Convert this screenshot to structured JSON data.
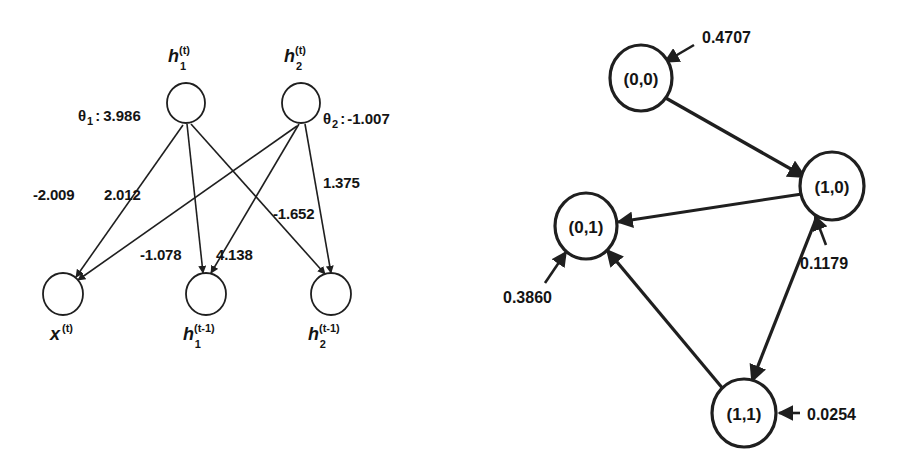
{
  "figure": {
    "background_color": "#ffffff",
    "ink_color": "#1f1f1f",
    "panels": [
      "rnn-weight-diagram",
      "state-transition-diagram"
    ]
  },
  "rnn_diagram": {
    "title": "",
    "nodes": {
      "h1_t": {
        "name": "h",
        "sub": "1",
        "sup": "(t)",
        "cx": 186,
        "cy": 103,
        "r": 19
      },
      "h2_t": {
        "name": "h",
        "sub": "2",
        "sup": "(t)",
        "cx": 301,
        "cy": 103,
        "r": 19
      },
      "x_t": {
        "name": "x",
        "sub": "",
        "sup": "(t)",
        "cx": 63,
        "cy": 294,
        "r": 20
      },
      "h1_tm1": {
        "name": "h",
        "sub": "1",
        "sup": "(t-1)",
        "cx": 206,
        "cy": 294,
        "r": 20
      },
      "h2_tm1": {
        "name": "h",
        "sub": "2",
        "sup": "(t-1)",
        "cx": 331,
        "cy": 294,
        "r": 20
      }
    },
    "biases": [
      {
        "symbol": "θ",
        "sub": "1",
        "separator": ":",
        "value": "3.986",
        "full": "θ 1 : 3.986"
      },
      {
        "symbol": "θ",
        "sub": "2",
        "separator": ":",
        "value": "-1.007",
        "full": "θ 2 : -1.007"
      }
    ],
    "edges": [
      {
        "id": "x-to-h1",
        "from": "x_t",
        "to": "h1_t",
        "weight": "-2.009"
      },
      {
        "id": "x-to-h2",
        "from": "x_t",
        "to": "h2_t",
        "weight": "2.012"
      },
      {
        "id": "h1prev-to-h1",
        "from": "h1_tm1",
        "to": "h1_t",
        "weight": "-1.078"
      },
      {
        "id": "h1prev-to-h2",
        "from": "h1_tm1",
        "to": "h2_t",
        "weight": "4.138"
      },
      {
        "id": "h2prev-to-h2",
        "from": "h2_tm1",
        "to": "h2_t",
        "weight": "1.375"
      },
      {
        "id": "h2prev-to-h1",
        "from": "h2_tm1",
        "to": "h1_t",
        "weight": "-1.652"
      }
    ]
  },
  "state_diagram": {
    "title": "",
    "states": [
      {
        "id": "s00",
        "label": "(0,0)",
        "probability": "0.4707",
        "cx": 641,
        "cy": 78,
        "r": 30
      },
      {
        "id": "s10",
        "label": "(1,0)",
        "probability": "0.1179",
        "cx": 832,
        "cy": 186,
        "r": 31
      },
      {
        "id": "s01",
        "label": "(0,1)",
        "probability": "0.3860",
        "cx": 586,
        "cy": 226,
        "r": 30
      },
      {
        "id": "s11",
        "label": "(1,1)",
        "probability": "0.0254",
        "cx": 744,
        "cy": 413,
        "r": 31
      }
    ],
    "transitions": [
      {
        "id": "t-00-10",
        "from": "s00",
        "to": "s10"
      },
      {
        "id": "t-10-01",
        "from": "s10",
        "to": "s01"
      },
      {
        "id": "t-11-01",
        "from": "s11",
        "to": "s01"
      },
      {
        "id": "t-10-11",
        "from": "s10",
        "to": "s11"
      }
    ]
  }
}
